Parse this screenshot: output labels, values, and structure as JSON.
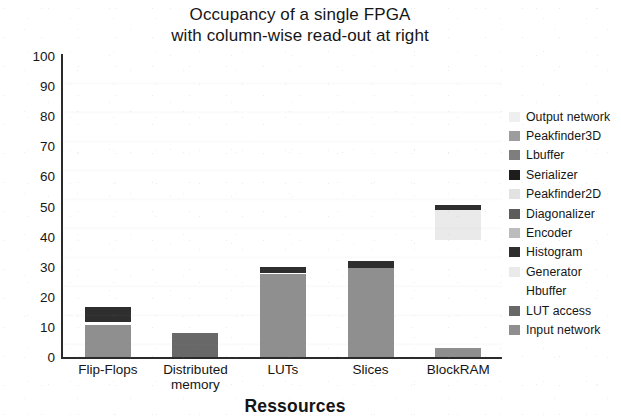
{
  "chart_data": {
    "type": "bar",
    "stacked": true,
    "title": "Occupancy of a single FPGA with column-wise read-out at right",
    "title_lines": [
      "Occupancy of a single FPGA",
      "with column-wise read-out at right"
    ],
    "xlabel": "Ressources",
    "ylabel": "Occupancy [%]",
    "ylim": [
      0,
      100
    ],
    "yticks": [
      100,
      90,
      80,
      70,
      60,
      50,
      40,
      30,
      20,
      10,
      0
    ],
    "grid": false,
    "legend_position": "right",
    "categories": [
      "Flip-Flops",
      "Distributed memory",
      "LUTs",
      "Slices",
      "BlockRAM"
    ],
    "category_lines": [
      [
        "Flip-Flops"
      ],
      [
        "Distributed",
        "memory"
      ],
      [
        "LUTs"
      ],
      [
        "Slices"
      ],
      [
        "BlockRAM"
      ]
    ],
    "series": [
      {
        "name": "Output network",
        "color": "#efefef",
        "values": [
          0,
          0,
          0,
          0,
          0
        ]
      },
      {
        "name": "Peakfinder3D",
        "color": "#9d9d9d",
        "values": [
          0,
          0,
          0,
          0,
          0
        ]
      },
      {
        "name": "Lbuffer",
        "color": "#7e7e7e",
        "values": [
          0,
          0,
          0,
          0,
          0
        ]
      },
      {
        "name": "Serializer",
        "color": "#1d1d1d",
        "values": [
          0,
          0,
          0,
          0,
          0
        ]
      },
      {
        "name": "Peakfinder2D",
        "color": "#e2e2e2",
        "values": [
          0,
          0,
          0,
          0,
          0
        ]
      },
      {
        "name": "Diagonalizer",
        "color": "#5c5c5c",
        "values": [
          0,
          0,
          0,
          0,
          0
        ]
      },
      {
        "name": "Encoder",
        "color": "#bcbcbc",
        "values": [
          0,
          0,
          0,
          0,
          0
        ]
      },
      {
        "name": "Histogram",
        "color": "#2e2e2e",
        "values": [
          5.0,
          0,
          2.0,
          2.5,
          1.5
        ]
      },
      {
        "name": "Generator",
        "color": "#eaeaea",
        "values": [
          0,
          0,
          0,
          0,
          10.0
        ]
      },
      {
        "name": "Hbuffer",
        "color": "#ffffff",
        "values": [
          1.0,
          0,
          0.5,
          0,
          36.0
        ]
      },
      {
        "name": "LUT access",
        "color": "#686868",
        "values": [
          0,
          8.0,
          0,
          0,
          0
        ]
      },
      {
        "name": "Input network",
        "color": "#8f8f8f",
        "values": [
          10.5,
          0,
          27.5,
          29.5,
          3.0
        ]
      }
    ],
    "totals": [
      16.5,
      8.0,
      30.0,
      32.0,
      50.5
    ],
    "annotations": []
  },
  "legend": {
    "items": [
      {
        "label": "Output network",
        "color": "#efefef"
      },
      {
        "label": "Peakfinder3D",
        "color": "#9d9d9d"
      },
      {
        "label": "Lbuffer",
        "color": "#7e7e7e"
      },
      {
        "label": "Serializer",
        "color": "#1d1d1d"
      },
      {
        "label": "Peakfinder2D",
        "color": "#e2e2e2"
      },
      {
        "label": "Diagonalizer",
        "color": "#5c5c5c"
      },
      {
        "label": "Encoder",
        "color": "#bcbcbc"
      },
      {
        "label": "Histogram",
        "color": "#2e2e2e"
      },
      {
        "label": "Generator",
        "color": "#eaeaea"
      },
      {
        "label": "Hbuffer",
        "color": "#ffffff"
      },
      {
        "label": "LUT access",
        "color": "#686868"
      },
      {
        "label": "Input network",
        "color": "#8f8f8f"
      }
    ]
  },
  "colors": {
    "axis": "#2b2b2b",
    "text": "#161616",
    "background": "#ffffff"
  }
}
